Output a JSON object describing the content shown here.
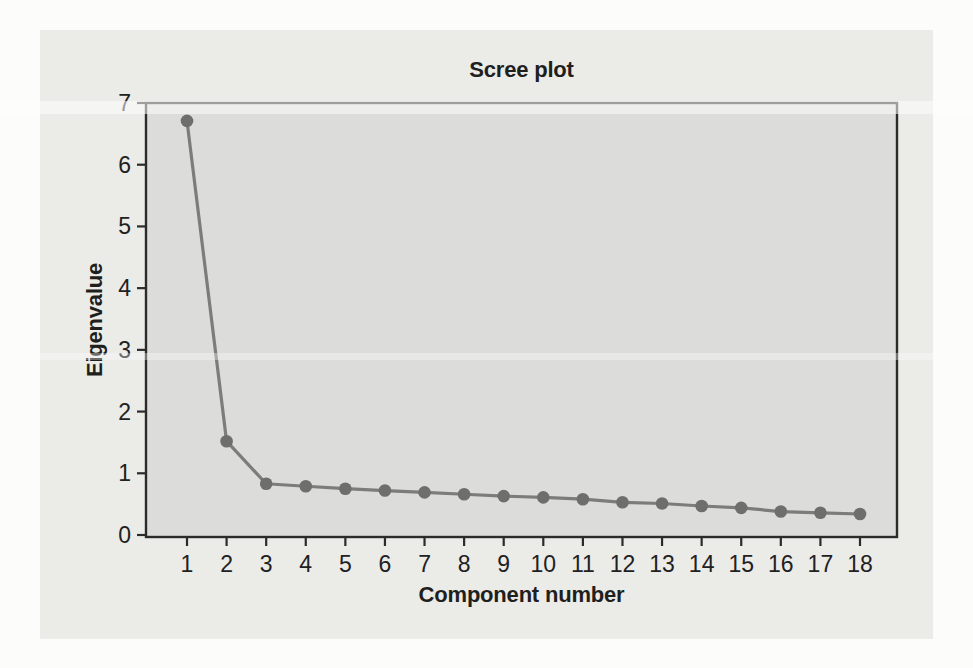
{
  "chart_data": {
    "type": "line",
    "title": "Scree plot",
    "xlabel": "Component number",
    "ylabel": "Eigenvalue",
    "x": [
      1,
      2,
      3,
      4,
      5,
      6,
      7,
      8,
      9,
      10,
      11,
      12,
      13,
      14,
      15,
      16,
      17,
      18
    ],
    "values": [
      6.71,
      1.52,
      0.83,
      0.79,
      0.75,
      0.72,
      0.69,
      0.66,
      0.63,
      0.61,
      0.58,
      0.53,
      0.51,
      0.47,
      0.44,
      0.38,
      0.36,
      0.34
    ],
    "ylim": [
      0,
      7
    ],
    "yticks": [
      0,
      1,
      2,
      3,
      4,
      5,
      6,
      7
    ],
    "grid": false,
    "legend": null,
    "colors": {
      "line": "#7c7c7a",
      "marker": "#6e6e6c",
      "axis": "#2b2b29",
      "text": "#21211f",
      "plot_bg": "#dcdcda",
      "panel_bg": "#ebebe8",
      "page_bg": "#fcfcfa"
    }
  }
}
